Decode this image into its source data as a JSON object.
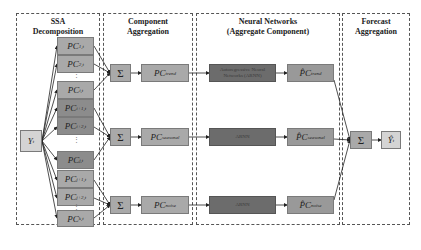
{
  "panels": [
    {
      "title_line1": "SSA",
      "title_line2": "Decomposition"
    },
    {
      "title_line1": "Component",
      "title_line2": "Aggregation"
    },
    {
      "title_line1": "Neural Networks",
      "title_line2": "(Aggregate Component)"
    },
    {
      "title_line1": "Forecast",
      "title_line2": "Aggregation"
    }
  ],
  "input": {
    "label": "Y",
    "sub": "t"
  },
  "pc_boxes": [
    {
      "label": "PC",
      "sub": "1,t"
    },
    {
      "label": "PC",
      "sub": "2,t"
    },
    {
      "label": "PC",
      "sub": "i,t"
    },
    {
      "label": "PC",
      "sub": "i+1,t"
    },
    {
      "label": "PC",
      "sub": "i+2,t"
    },
    {
      "label": "PC",
      "sub": "j,t"
    },
    {
      "label": "PC",
      "sub": "j+1,t"
    },
    {
      "label": "PC",
      "sub": "j+2,t"
    },
    {
      "label": "PC",
      "sub": "k,t"
    }
  ],
  "sum_symbol": "Σ",
  "aggregates": [
    {
      "label": "PC",
      "sub": "trend"
    },
    {
      "label": "PC",
      "sub": "seasonal"
    },
    {
      "label": "PC",
      "sub": "noise"
    }
  ],
  "networks": [
    {
      "label": "Autoregressive Neural Networks (ARNN)"
    },
    {
      "label": "ARNN"
    },
    {
      "label": "ARNN"
    }
  ],
  "forecasts": [
    {
      "label": "P̂C",
      "sub": "trend"
    },
    {
      "label": "P̂C",
      "sub": "seasonal"
    },
    {
      "label": "P̂C",
      "sub": "noise"
    }
  ],
  "output": {
    "label": "Ŷ",
    "sub": "t"
  },
  "ellipsis": "⋮"
}
